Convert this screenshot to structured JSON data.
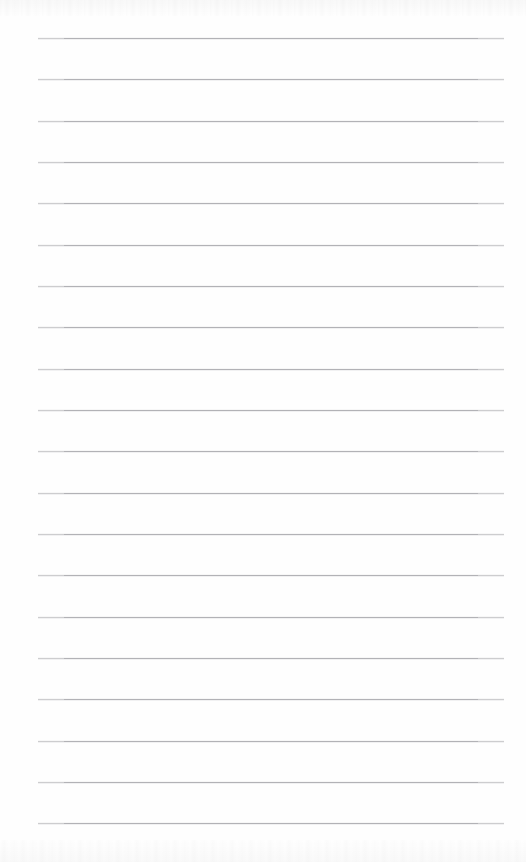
{
  "document": {
    "kind": "blank-ruled-notepad-page",
    "title": "Blank Ruled Notepad Page",
    "page_width": 526,
    "page_height": 862,
    "background_color": "#fefefe",
    "has_text_content": false,
    "text_content": "",
    "heading": "",
    "body_text": "",
    "footer_text": "",
    "page_number": ""
  },
  "ruling": {
    "line_count": 20,
    "line_color": "#b2b2b6",
    "line_thickness_px": 1,
    "left_margin_x": 38,
    "right_edge_x": 504,
    "line_length_px": 466,
    "first_line_y": 38,
    "last_line_y": 823,
    "line_spacing_px": 41.3,
    "line_y_positions": [
      38,
      79,
      121,
      162,
      203,
      245,
      286,
      327,
      369,
      410,
      451,
      493,
      534,
      575,
      617,
      658,
      699,
      741,
      782,
      823
    ]
  },
  "artifacts": {
    "top_noise_label": "scan-noise-top",
    "bottom_noise_label": "scan-noise-bottom"
  }
}
